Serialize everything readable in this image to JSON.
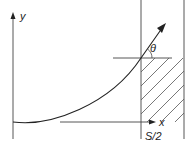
{
  "diagram": {
    "axis_y_label": "y",
    "axis_x_label": "x",
    "angle_label": "θ",
    "boundary_label": "S/2",
    "colors": {
      "line": "#222222",
      "hatch": "#555555",
      "background": "#ffffff"
    },
    "elements": [
      "y-axis with arrow",
      "x-axis arrow at bottom",
      "upward curving trajectory with arrowhead",
      "vertical boundary line at S/2",
      "right vertical boundary line",
      "horizontal reference line at intersection",
      "angle theta between trajectory and horizontal",
      "hatched region right of S/2"
    ]
  }
}
